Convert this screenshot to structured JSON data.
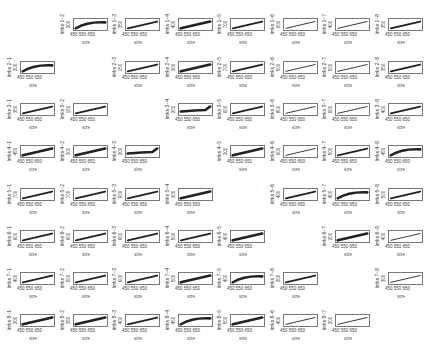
{
  "chart_data": {
    "type": "scatter",
    "layout": "8x8 grid of small scatter panels, diagonal empty",
    "xlabel": "size",
    "x_ticks": [
      450,
      550,
      650
    ],
    "ylabel_pattern": "lmks i-j",
    "panels": [
      {
        "row": 1,
        "col": 2,
        "ylabel": "lmks 1−2",
        "ytick": "200",
        "shape": "curve"
      },
      {
        "row": 1,
        "col": 3,
        "ylabel": "lmks 1−3",
        "ytick": "350",
        "shape": "line"
      },
      {
        "row": 1,
        "col": 4,
        "ylabel": "lmks 1−4",
        "ytick": "400",
        "shape": "band"
      },
      {
        "row": 1,
        "col": 5,
        "ylabel": "lmks 1−5",
        "ytick": "700",
        "shape": "line"
      },
      {
        "row": 1,
        "col": 6,
        "ylabel": "lmks 1−6",
        "ytick": "600",
        "shape": "thin"
      },
      {
        "row": 1,
        "col": 7,
        "ylabel": "lmks 1−7",
        "ytick": "400",
        "shape": "thin"
      },
      {
        "row": 1,
        "col": 8,
        "ylabel": "lmks 1−8",
        "ytick": "350",
        "shape": "line"
      },
      {
        "row": 2,
        "col": 1,
        "ylabel": "lmks 2−1",
        "ytick": "200",
        "shape": "curve"
      },
      {
        "row": 2,
        "col": 3,
        "ylabel": "lmks 2−3",
        "ytick": "150",
        "shape": "line"
      },
      {
        "row": 2,
        "col": 4,
        "ylabel": "lmks 2−4",
        "ytick": "300",
        "shape": "band"
      },
      {
        "row": 2,
        "col": 5,
        "ylabel": "lmks 2−5",
        "ytick": "700",
        "shape": "line"
      },
      {
        "row": 2,
        "col": 6,
        "ylabel": "lmks 2−6",
        "ytick": "500",
        "shape": "thin"
      },
      {
        "row": 2,
        "col": 7,
        "ylabel": "lmks 2−7",
        "ytick": "500",
        "shape": "thin"
      },
      {
        "row": 2,
        "col": 8,
        "ylabel": "lmks 2−8",
        "ytick": "350",
        "shape": "line"
      },
      {
        "row": 3,
        "col": 1,
        "ylabel": "lmks 3−1",
        "ytick": "350",
        "shape": "line"
      },
      {
        "row": 3,
        "col": 2,
        "ylabel": "lmks 3−2",
        "ytick": "150",
        "shape": "line"
      },
      {
        "row": 3,
        "col": 4,
        "ylabel": "lmks 3−4",
        "ytick": "200",
        "shape": "flat"
      },
      {
        "row": 3,
        "col": 5,
        "ylabel": "lmks 3−5",
        "ytick": "600",
        "shape": "line"
      },
      {
        "row": 3,
        "col": 6,
        "ylabel": "lmks 3−6",
        "ytick": "800",
        "shape": "thin"
      },
      {
        "row": 3,
        "col": 7,
        "ylabel": "lmks 3−7",
        "ytick": "600",
        "shape": "thin"
      },
      {
        "row": 3,
        "col": 8,
        "ylabel": "lmks 3−8",
        "ytick": "400",
        "shape": "line"
      },
      {
        "row": 4,
        "col": 1,
        "ylabel": "lmks 4−1",
        "ytick": "450",
        "shape": "band"
      },
      {
        "row": 4,
        "col": 2,
        "ylabel": "lmks 4−2",
        "ytick": "300",
        "shape": "band"
      },
      {
        "row": 4,
        "col": 3,
        "ylabel": "lmks 4−3",
        "ytick": "200",
        "shape": "flat"
      },
      {
        "row": 4,
        "col": 5,
        "ylabel": "lmks 4−5",
        "ytick": "300",
        "shape": "band"
      },
      {
        "row": 4,
        "col": 6,
        "ylabel": "lmks 4−6",
        "ytick": "600",
        "shape": "thin"
      },
      {
        "row": 4,
        "col": 7,
        "ylabel": "lmks 4−7",
        "ytick": "500",
        "shape": "line"
      },
      {
        "row": 4,
        "col": 8,
        "ylabel": "lmks 4−8",
        "ytick": "450",
        "shape": "curve"
      },
      {
        "row": 5,
        "col": 1,
        "ylabel": "lmks 5−1",
        "ytick": "700",
        "shape": "line"
      },
      {
        "row": 5,
        "col": 2,
        "ylabel": "lmks 5−2",
        "ytick": "700",
        "shape": "line"
      },
      {
        "row": 5,
        "col": 3,
        "ylabel": "lmks 5−3",
        "ytick": "600",
        "shape": "line"
      },
      {
        "row": 5,
        "col": 4,
        "ylabel": "lmks 5−4",
        "ytick": "300",
        "shape": "band"
      },
      {
        "row": 5,
        "col": 6,
        "ylabel": "lmks 5−6",
        "ytick": "400",
        "shape": "line"
      },
      {
        "row": 5,
        "col": 7,
        "ylabel": "lmks 5−7",
        "ytick": "400",
        "shape": "curve"
      },
      {
        "row": 5,
        "col": 8,
        "ylabel": "lmks 5−8",
        "ytick": "500",
        "shape": "line"
      },
      {
        "row": 6,
        "col": 1,
        "ylabel": "lmks 6−1",
        "ytick": "600",
        "shape": "line"
      },
      {
        "row": 6,
        "col": 2,
        "ylabel": "lmks 6−2",
        "ytick": "600",
        "shape": "line"
      },
      {
        "row": 6,
        "col": 3,
        "ylabel": "lmks 6−3",
        "ytick": "600",
        "shape": "line"
      },
      {
        "row": 6,
        "col": 4,
        "ylabel": "lmks 6−4",
        "ytick": "500",
        "shape": "line"
      },
      {
        "row": 6,
        "col": 5,
        "ylabel": "lmks 6−5",
        "ytick": "400",
        "shape": "band"
      },
      {
        "row": 6,
        "col": 7,
        "ylabel": "lmks 6−7",
        "ytick": "200",
        "shape": "band"
      },
      {
        "row": 6,
        "col": 8,
        "ylabel": "lmks 6−8",
        "ytick": "400",
        "shape": "thin"
      },
      {
        "row": 7,
        "col": 1,
        "ylabel": "lmks 7−1",
        "ytick": "400",
        "shape": "line"
      },
      {
        "row": 7,
        "col": 2,
        "ylabel": "lmks 7−2",
        "ytick": "500",
        "shape": "line"
      },
      {
        "row": 7,
        "col": 3,
        "ylabel": "lmks 7−3",
        "ytick": "600",
        "shape": "line"
      },
      {
        "row": 7,
        "col": 4,
        "ylabel": "lmks 7−4",
        "ytick": "500",
        "shape": "band"
      },
      {
        "row": 7,
        "col": 5,
        "ylabel": "lmks 7−5",
        "ytick": "400",
        "shape": "curve"
      },
      {
        "row": 7,
        "col": 6,
        "ylabel": "lmks 7−6",
        "ytick": "200",
        "shape": "line"
      },
      {
        "row": 7,
        "col": 8,
        "ylabel": "lmks 7−8",
        "ytick": "300",
        "shape": "thin"
      },
      {
        "row": 8,
        "col": 1,
        "ylabel": "lmks 8−1",
        "ytick": "200",
        "shape": "band"
      },
      {
        "row": 8,
        "col": 2,
        "ylabel": "lmks 8−2",
        "ytick": "350",
        "shape": "band"
      },
      {
        "row": 8,
        "col": 3,
        "ylabel": "lmks 8−3",
        "ytick": "400",
        "shape": "line"
      },
      {
        "row": 8,
        "col": 4,
        "ylabel": "lmks 8−4",
        "ytick": "450",
        "shape": "curve"
      },
      {
        "row": 8,
        "col": 5,
        "ylabel": "lmks 8−5",
        "ytick": "500",
        "shape": "band"
      },
      {
        "row": 8,
        "col": 6,
        "ylabel": "lmks 8−6",
        "ytick": "400",
        "shape": "thin"
      },
      {
        "row": 8,
        "col": 7,
        "ylabel": "lmks 8−7",
        "ytick": "200",
        "shape": "thin"
      }
    ],
    "grid": false,
    "legend": null
  }
}
